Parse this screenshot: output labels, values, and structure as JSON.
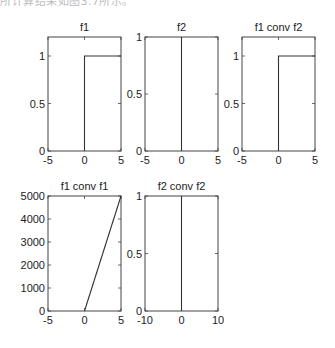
{
  "caption": "所计算结果如图3.7所示。",
  "chart_data": [
    {
      "type": "line",
      "title": "f1",
      "xlabel": "",
      "ylabel": "",
      "xlim": [
        -5,
        5
      ],
      "ylim": [
        0,
        1.2
      ],
      "xticks": [
        "-5",
        "0",
        "5"
      ],
      "yticks": [
        "0",
        "0.5",
        "1"
      ],
      "series": [
        {
          "name": "f1",
          "x": [
            0,
            0,
            5
          ],
          "y": [
            0,
            1,
            1
          ]
        }
      ],
      "grid": false
    },
    {
      "type": "line",
      "title": "f2",
      "xlabel": "",
      "ylabel": "",
      "xlim": [
        -5,
        5
      ],
      "ylim": [
        0,
        1
      ],
      "xticks": [
        "-5",
        "0",
        "5"
      ],
      "yticks": [
        "0",
        "0.5",
        "1"
      ],
      "series": [
        {
          "name": "f2",
          "x": [
            0,
            0
          ],
          "y": [
            0,
            1
          ]
        }
      ],
      "grid": false
    },
    {
      "type": "line",
      "title": "f1 conv f2",
      "xlabel": "",
      "ylabel": "",
      "xlim": [
        -5,
        5
      ],
      "ylim": [
        0,
        1.2
      ],
      "xticks": [
        "-5",
        "0",
        "5"
      ],
      "yticks": [
        "0",
        "0.5",
        "1"
      ],
      "series": [
        {
          "name": "f1 conv f2",
          "x": [
            0,
            0,
            5
          ],
          "y": [
            0,
            1,
            1
          ]
        }
      ],
      "grid": false
    },
    {
      "type": "line",
      "title": "f1 conv f1",
      "xlabel": "",
      "ylabel": "",
      "xlim": [
        -5,
        5
      ],
      "ylim": [
        0,
        5000
      ],
      "xticks": [
        "-5",
        "0",
        "5"
      ],
      "yticks": [
        "0",
        "1000",
        "2000",
        "3000",
        "4000",
        "5000"
      ],
      "series": [
        {
          "name": "f1 conv f1",
          "x": [
            0,
            5
          ],
          "y": [
            0,
            5000
          ]
        }
      ],
      "grid": false
    },
    {
      "type": "line",
      "title": "f2 conv f2",
      "xlabel": "",
      "ylabel": "",
      "xlim": [
        -10,
        10
      ],
      "ylim": [
        0,
        1
      ],
      "xticks": [
        "-10",
        "0",
        "10"
      ],
      "yticks": [
        "0",
        "0.5",
        "1"
      ],
      "series": [
        {
          "name": "f2 conv f2",
          "x": [
            0,
            0
          ],
          "y": [
            0,
            1
          ]
        }
      ],
      "grid": false
    }
  ]
}
